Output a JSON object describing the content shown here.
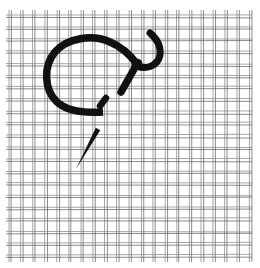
{
  "illustration": {
    "subject": "Needle and thread forming a looped stitch on double-thread mesh canvas",
    "canvas": {
      "x0": 6,
      "y0": 10,
      "x1": 252,
      "y1": 262,
      "cols": 21,
      "rows": 21,
      "pitch": 12,
      "thread_gap": 2.4,
      "thread_color": "#8a8a8a",
      "thread_shadow": "#5e5e5e"
    },
    "stitch": {
      "color": "#111111",
      "loop_width": 7.5,
      "hook_width": 7,
      "knot": {
        "cx": 137,
        "cy": 64,
        "r": 5.5
      },
      "dash": {
        "x1": 100,
        "y1": 106,
        "x2": 106,
        "y2": 98,
        "width": 6.5
      },
      "needle": {
        "x_eye": 98,
        "y_eye": 129,
        "x_tip": 76,
        "y_tip": 169,
        "base_width": 5
      }
    }
  }
}
